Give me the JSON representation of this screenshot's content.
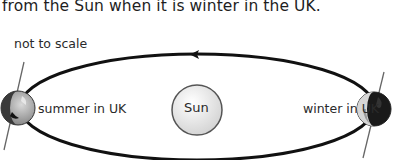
{
  "caption": "from the Sun when it is winter in the UK.",
  "diagram": {
    "note": "not to scale",
    "sun_label": "Sun",
    "positions": [
      {
        "label": "summer in UK",
        "side": "left"
      },
      {
        "label": "winter in UK",
        "side": "right"
      }
    ],
    "orbit_direction": "anticlockwise (arrow at top pointing left)",
    "colors": {
      "orbit": "#111111",
      "sun_fill": "#e6e6e6",
      "sun_stroke": "#555555",
      "earth_dark": "#1a1a1a",
      "earth_light": "#bdbdbd",
      "axis": "#666666"
    }
  }
}
